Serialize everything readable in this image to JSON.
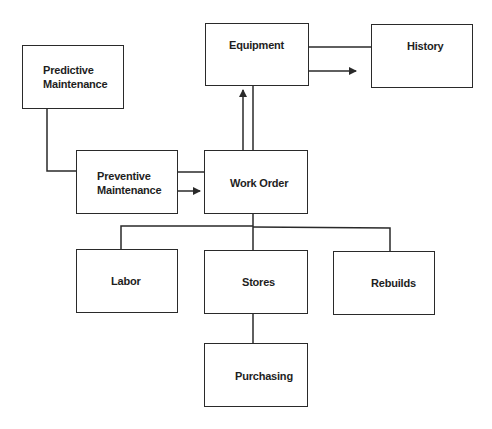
{
  "diagram": {
    "nodes": {
      "predictive": {
        "label": "Predictive\nMaintenance"
      },
      "equipment": {
        "label": "Equipment"
      },
      "history": {
        "label": "History"
      },
      "preventive": {
        "label": "Preventive\nMaintenance"
      },
      "work_order": {
        "label": "Work Order"
      },
      "labor": {
        "label": "Labor"
      },
      "stores": {
        "label": "Stores"
      },
      "rebuilds": {
        "label": "Rebuilds"
      },
      "purchasing": {
        "label": "Purchasing"
      }
    },
    "edges": [
      {
        "from": "predictive",
        "to": "preventive",
        "type": "line"
      },
      {
        "from": "preventive",
        "to": "work_order",
        "type": "line+arrow"
      },
      {
        "from": "work_order",
        "to": "equipment",
        "type": "line+arrow"
      },
      {
        "from": "equipment",
        "to": "history",
        "type": "line+arrow"
      },
      {
        "from": "work_order",
        "to": "labor",
        "type": "line"
      },
      {
        "from": "work_order",
        "to": "stores",
        "type": "line"
      },
      {
        "from": "work_order",
        "to": "rebuilds",
        "type": "line"
      },
      {
        "from": "stores",
        "to": "purchasing",
        "type": "line"
      }
    ],
    "colors": {
      "stroke": "#2a2a2a",
      "text": "#1e1e1e",
      "background": "#ffffff"
    }
  }
}
